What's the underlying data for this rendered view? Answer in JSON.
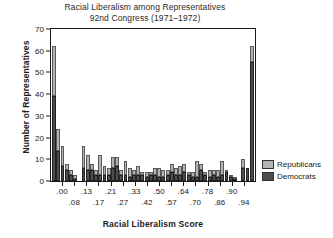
{
  "chart_data": {
    "type": "bar",
    "title": "Racial Liberalism among Representatives",
    "subtitle": "92nd Congress (1971–1972)",
    "xlabel": "Racial Liberalism Score",
    "ylabel": "Number of Representatives",
    "ylim": [
      0,
      70
    ],
    "yticks": [
      0,
      10,
      20,
      30,
      40,
      50,
      60,
      70
    ],
    "grid": false,
    "legend_position": "right",
    "stacked": true,
    "colors": {
      "republicans": "#b3b3b3",
      "democrats": "#4d4d4d",
      "axis": "#1a1a1a"
    },
    "legend": [
      {
        "name": "Republicans",
        "color": "#b3b3b3"
      },
      {
        "name": "Democrats",
        "color": "#4d4d4d"
      }
    ],
    "xtick_labels_row0": [
      ".00",
      ".13",
      ".21",
      ".33",
      ".50",
      ".64",
      ".78",
      ".90"
    ],
    "xtick_labels_row1": [
      ".08",
      ".17",
      ".27",
      ".42",
      ".57",
      ".70",
      ".86",
      ".94"
    ],
    "xtick_labels_ordered": [
      ".00",
      ".08",
      ".13",
      ".17",
      ".21",
      ".27",
      ".33",
      ".42",
      ".50",
      ".57",
      ".64",
      ".70",
      ".78",
      ".86",
      ".90",
      ".94"
    ],
    "categories": [
      "0.00",
      "0.02",
      "0.04",
      "0.06",
      "0.08",
      "0.10",
      "0.12",
      "0.13",
      "0.15",
      "0.17",
      "0.19",
      "0.21",
      "0.23",
      "0.25",
      "0.27",
      "0.29",
      "0.31",
      "0.33",
      "0.35",
      "0.37",
      "0.39",
      "0.42",
      "0.44",
      "0.46",
      "0.48",
      "0.50",
      "0.52",
      "0.54",
      "0.57",
      "0.59",
      "0.61",
      "0.64",
      "0.66",
      "0.68",
      "0.70",
      "0.72",
      "0.74",
      "0.78",
      "0.80",
      "0.82",
      "0.86",
      "0.88",
      "0.90",
      "0.92",
      "0.94",
      "0.96",
      "0.98",
      "1.00"
    ],
    "series": [
      {
        "name": "Democrats",
        "color": "#4d4d4d",
        "values": [
          39,
          14,
          7,
          5,
          3,
          1,
          0,
          6,
          5,
          5,
          3,
          3,
          3,
          3,
          6,
          7,
          3,
          3,
          2,
          3,
          3,
          3,
          2,
          3,
          3,
          2,
          2,
          3,
          4,
          3,
          3,
          4,
          3,
          2,
          2,
          5,
          3,
          2,
          3,
          2,
          3,
          4,
          2,
          1,
          0,
          6,
          6,
          55
        ]
      },
      {
        "name": "Republicans",
        "color": "#b3b3b3",
        "values": [
          23,
          10,
          9,
          3,
          2,
          2,
          0,
          10,
          7,
          3,
          2,
          9,
          4,
          3,
          5,
          4,
          2,
          6,
          4,
          2,
          4,
          1,
          2,
          1,
          3,
          4,
          3,
          2,
          4,
          3,
          4,
          4,
          1,
          2,
          7,
          3,
          1,
          3,
          2,
          3,
          6,
          1,
          1,
          1,
          0,
          4,
          0,
          7
        ]
      }
    ]
  }
}
